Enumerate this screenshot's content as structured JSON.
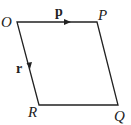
{
  "diagram": {
    "type": "parallelogram",
    "vertices": {
      "O": {
        "label": "O",
        "x": 17,
        "y": 22
      },
      "P": {
        "label": "P",
        "x": 97,
        "y": 22
      },
      "Q": {
        "label": "Q",
        "x": 118,
        "y": 105
      },
      "R": {
        "label": "R",
        "x": 39,
        "y": 105
      }
    },
    "vectors": [
      {
        "label": "p",
        "from": "O",
        "to": "P"
      },
      {
        "label": "r",
        "from": "O",
        "to": "R"
      }
    ],
    "line_color": "#222222"
  }
}
